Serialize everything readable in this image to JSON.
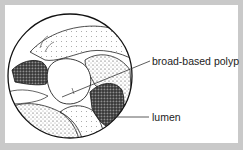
{
  "figure": {
    "type": "endoscopic view illustration",
    "frame_color": "#c9c9c9",
    "background": "#ffffff",
    "labels": [
      {
        "id": "polyp",
        "text": "broad-based polyp"
      },
      {
        "id": "lumen",
        "text": "lumen"
      }
    ]
  }
}
